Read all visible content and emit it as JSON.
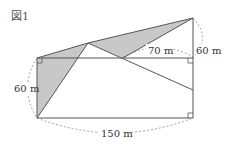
{
  "figure": {
    "title": "図1",
    "labels": {
      "top_right_distance": "70 m",
      "right_height": "60 m",
      "left_height": "60 m",
      "bottom_width": "150 m"
    },
    "colors": {
      "shade": "#c8c8c8",
      "line": "#555555",
      "dashed": "#777777"
    }
  }
}
